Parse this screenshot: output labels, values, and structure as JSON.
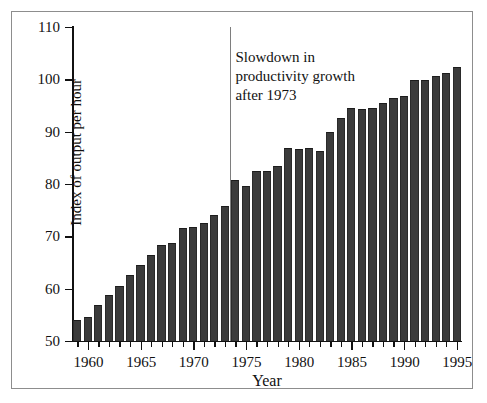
{
  "chart_data": {
    "type": "bar",
    "title": "",
    "xlabel": "Year",
    "ylabel": "Index of output per hour",
    "ylim": [
      50,
      110
    ],
    "yticks": [
      50,
      60,
      70,
      80,
      90,
      100,
      110
    ],
    "xlim": [
      1958.5,
      1995.5
    ],
    "xticks_major": [
      1960,
      1965,
      1970,
      1975,
      1980,
      1985,
      1990,
      1995
    ],
    "xtick_labels": [
      "1960",
      "1965",
      "1970",
      "1975",
      "1980",
      "1985",
      "1990",
      "1995"
    ],
    "grid": false,
    "legend": false,
    "bar_color": "#3b3b3b",
    "categories": [
      1959,
      1960,
      1961,
      1962,
      1963,
      1964,
      1965,
      1966,
      1967,
      1968,
      1969,
      1970,
      1971,
      1972,
      1973,
      1974,
      1975,
      1976,
      1977,
      1978,
      1979,
      1980,
      1981,
      1982,
      1983,
      1984,
      1985,
      1986,
      1987,
      1988,
      1989,
      1990,
      1991,
      1992,
      1993,
      1994,
      1995
    ],
    "values": [
      54.0,
      54.5,
      56.8,
      58.8,
      60.6,
      62.6,
      64.5,
      66.5,
      68.3,
      68.7,
      71.6,
      71.7,
      72.5,
      74.0,
      75.8,
      80.7,
      79.6,
      82.5,
      82.5,
      83.5,
      86.9,
      86.6,
      86.9,
      86.4,
      89.9,
      92.7,
      94.5,
      94.3,
      94.6,
      95.4,
      96.5,
      96.8,
      99.9,
      99.9,
      100.7,
      101.2,
      102.3
    ],
    "annotations": [
      {
        "name": "slowdown-note",
        "lines": [
          "Slowdown in",
          "productivity growth",
          "after 1973"
        ],
        "x": 1974.0,
        "y": 106.0
      }
    ],
    "reference_lines": [
      {
        "name": "year-1973-divider",
        "orientation": "vertical",
        "x": 1973.5,
        "color": "#7e7e7e"
      }
    ]
  }
}
